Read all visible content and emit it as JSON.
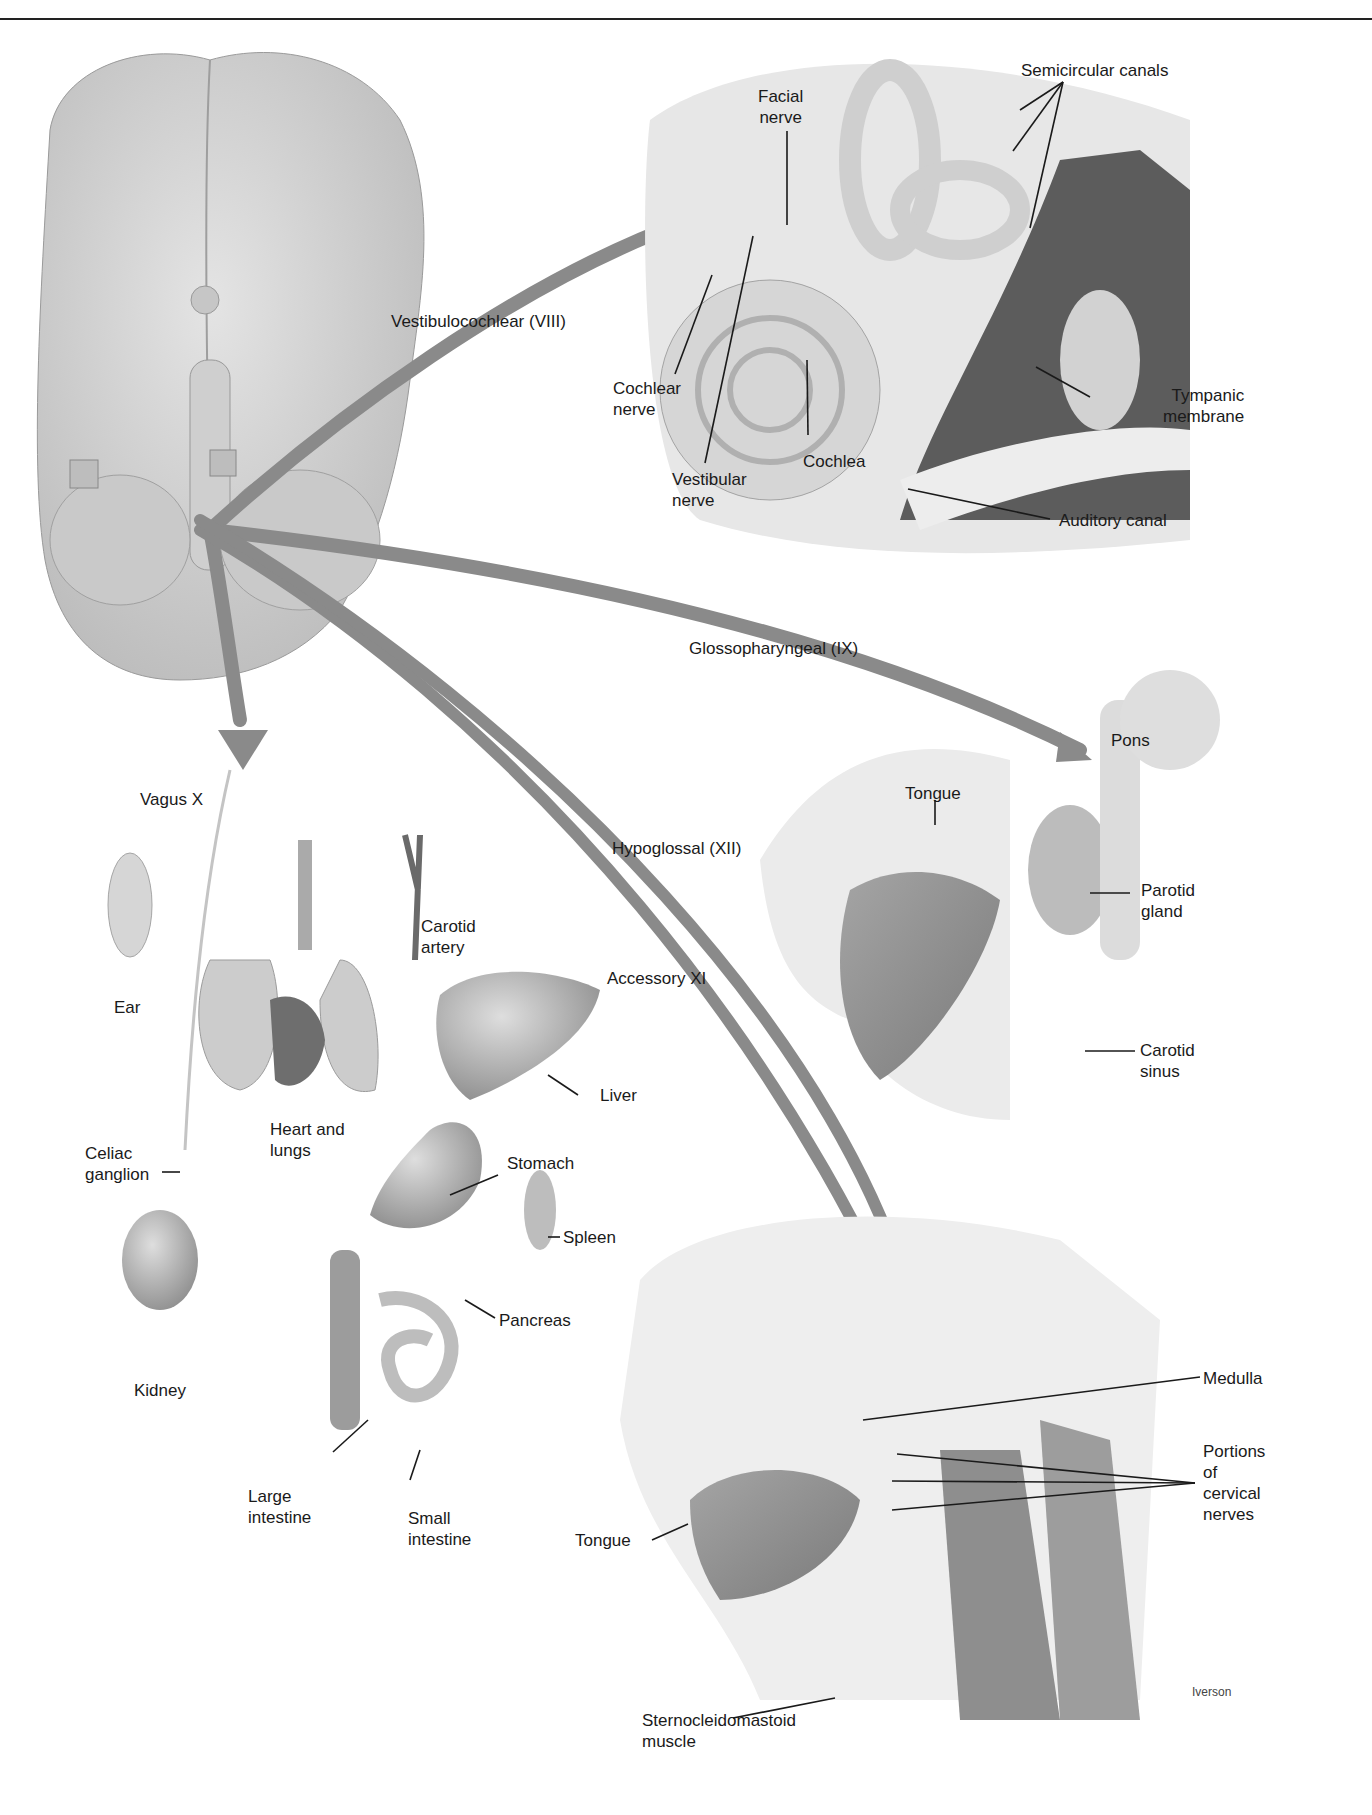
{
  "figure": {
    "signature": "Iverson",
    "colors": {
      "nerve_arrow": "#8a8a8a",
      "tissue_light": "#d9d9d9",
      "tissue_mid": "#b3b3b3",
      "tissue_dark": "#6f6f6f",
      "leader": "#1a1a1a"
    },
    "nerves": [
      {
        "id": "viii",
        "label": "Vestibulocochlear (VIII)"
      },
      {
        "id": "ix",
        "label": "Glossopharyngeal (IX)"
      },
      {
        "id": "x",
        "label": "Vagus X"
      },
      {
        "id": "xi",
        "label": "Accessory XI"
      },
      {
        "id": "xii",
        "label": "Hypoglossal (XII)"
      }
    ],
    "ear_panel": {
      "labels": {
        "facial_nerve": "Facial\nnerve",
        "semicircular_canals": "Semicircular canals",
        "cochlear_nerve": "Cochlear\nnerve",
        "cochlea": "Cochlea",
        "vestibular_nerve": "Vestibular\nnerve",
        "tympanic_membrane": "Tympanic\nmembrane",
        "auditory_canal": "Auditory canal"
      }
    },
    "vagus_panel": {
      "labels": {
        "ear": "Ear",
        "carotid_artery": "Carotid\nartery",
        "heart_and_lungs": "Heart and\nlungs",
        "liver": "Liver",
        "celiac_ganglion": "Celiac\nganglion",
        "stomach": "Stomach",
        "spleen": "Spleen",
        "pancreas": "Pancreas",
        "kidney": "Kidney",
        "large_intestine": "Large\nintestine",
        "small_intestine": "Small\nintestine"
      }
    },
    "glosso_panel": {
      "labels": {
        "pons": "Pons",
        "tongue": "Tongue",
        "parotid_gland": "Parotid\ngland",
        "carotid_sinus": "Carotid\nsinus"
      }
    },
    "neck_panel": {
      "labels": {
        "medulla": "Medulla",
        "portions_cervical": "Portions\nof\ncervical\nnerves",
        "tongue": "Tongue",
        "sternocleidomastoid": "Sternocleidomastoid\nmuscle"
      }
    }
  }
}
